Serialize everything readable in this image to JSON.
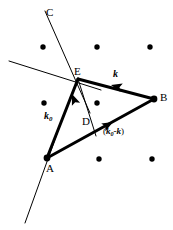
{
  "figure": {
    "type": "geometry-diagram",
    "background_color": "#ffffff",
    "ink_color": "#000000",
    "width": 173,
    "height": 230
  },
  "point_labels": [
    {
      "name": "C",
      "text": "C",
      "x": 46,
      "y": 7,
      "font_size": 11
    },
    {
      "name": "E",
      "text": "E",
      "x": 74,
      "y": 66,
      "font_size": 11
    },
    {
      "name": "B",
      "text": "B",
      "x": 160,
      "y": 92,
      "font_size": 11
    },
    {
      "name": "D",
      "text": "D",
      "x": 82,
      "y": 116,
      "font_size": 11
    },
    {
      "name": "A",
      "text": "A",
      "x": 46,
      "y": 163,
      "font_size": 11
    }
  ],
  "vector_labels": {
    "k0": {
      "base": "k",
      "subscript": "0",
      "x": 44,
      "y": 111,
      "font_size": 10
    },
    "k": {
      "base": "k",
      "subscript": "",
      "x": 113,
      "y": 69,
      "font_size": 10
    },
    "k0_minus_k": {
      "open": "(",
      "base": "k",
      "subscript": "0",
      "operator": "-",
      "base2": "k",
      "close": ")",
      "x": 103,
      "y": 127,
      "font_size": 9
    }
  },
  "lattice_dots": [
    {
      "x": 43,
      "y": 47,
      "r": 2.7
    },
    {
      "x": 97,
      "y": 47,
      "r": 2.7
    },
    {
      "x": 150,
      "y": 47,
      "r": 2.7
    },
    {
      "x": 44,
      "y": 103,
      "r": 2.7
    },
    {
      "x": 97,
      "y": 103,
      "r": 2.7
    },
    {
      "x": 99,
      "y": 159,
      "r": 2.7
    },
    {
      "x": 152,
      "y": 159,
      "r": 2.7
    }
  ],
  "vertices": {
    "A": {
      "x": 47,
      "y": 158,
      "r": 3.4
    },
    "B": {
      "x": 154,
      "y": 99,
      "r": 3.4
    },
    "E": {
      "x": 78,
      "y": 79,
      "r": 0
    }
  },
  "thick_segments": [
    {
      "name": "segment-a-e",
      "x1": 47,
      "y1": 158,
      "x2": 78,
      "y2": 79,
      "width": 3.0
    },
    {
      "name": "segment-e-b",
      "x1": 78,
      "y1": 79,
      "x2": 154,
      "y2": 99,
      "width": 3.0
    },
    {
      "name": "segment-a-b",
      "x1": 47,
      "y1": 158,
      "x2": 154,
      "y2": 99,
      "width": 3.0
    }
  ],
  "thin_lines": [
    {
      "name": "line-c-through-e",
      "x1": 45,
      "y1": 11,
      "x2": 90,
      "y2": 113,
      "width": 1.0
    },
    {
      "name": "line-upper-left-through-e",
      "x1": 9,
      "y1": 61,
      "x2": 101,
      "y2": 90,
      "width": 1.0
    },
    {
      "name": "line-e-to-d-extended",
      "x1": 78,
      "y1": 79,
      "x2": 96,
      "y2": 136,
      "width": 1.0
    },
    {
      "name": "line-through-a-lower",
      "x1": 58,
      "y1": 131,
      "x2": 25,
      "y2": 223,
      "width": 1.0
    }
  ],
  "arrowheads": [
    {
      "name": "arrowhead-k0",
      "tip_x": 72,
      "tip_y": 94,
      "angle_deg": 248.6,
      "size": 11
    },
    {
      "name": "arrowhead-k",
      "tip_x": 111,
      "tip_y": 85,
      "angle_deg": 194.8,
      "size": 11
    },
    {
      "name": "arrowhead-k0-minus-k",
      "tip_x": 113,
      "tip_y": 122,
      "angle_deg": 331.1,
      "size": 11
    }
  ]
}
